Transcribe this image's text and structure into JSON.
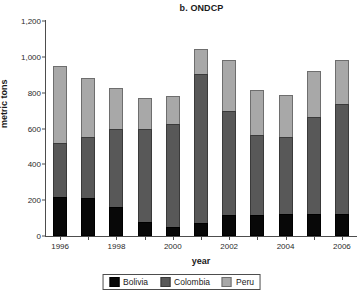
{
  "chart_data": {
    "type": "bar",
    "title": "b. ONDCP",
    "xlabel": "year",
    "ylabel": "metric tons",
    "ylim": [
      0,
      1200
    ],
    "ytick_labels": [
      "0",
      "200",
      "400",
      "600",
      "800",
      "1,000",
      "1,200"
    ],
    "ytick_values": [
      0,
      200,
      400,
      600,
      800,
      1000,
      1200
    ],
    "categories": [
      "1996",
      "1997",
      "1998",
      "1999",
      "2000",
      "2001",
      "2002",
      "2003",
      "2004",
      "2005",
      "2006"
    ],
    "xtick_labels": [
      "1996",
      "1998",
      "2000",
      "2002",
      "2004",
      "2006"
    ],
    "stacked": true,
    "grid": false,
    "legend_position": "bottom",
    "series": [
      {
        "name": "Bolivia",
        "color": "#080808",
        "values": [
          220,
          210,
          160,
          80,
          50,
          70,
          120,
          115,
          125,
          125,
          125
        ]
      },
      {
        "name": "Colombia",
        "color": "#585858",
        "values": [
          300,
          345,
          435,
          515,
          575,
          835,
          580,
          450,
          430,
          540,
          610
        ]
      },
      {
        "name": "Peru",
        "color": "#a8a8a8",
        "values": [
          430,
          325,
          230,
          175,
          155,
          140,
          280,
          250,
          230,
          255,
          245
        ]
      }
    ],
    "totals": [
      950,
      880,
      825,
      770,
      780,
      1045,
      980,
      815,
      785,
      920,
      980
    ]
  },
  "legend": {
    "items": [
      {
        "label": "Bolivia",
        "key": "bolivia"
      },
      {
        "label": "Colombia",
        "key": "colombia"
      },
      {
        "label": "Peru",
        "key": "peru"
      }
    ]
  }
}
